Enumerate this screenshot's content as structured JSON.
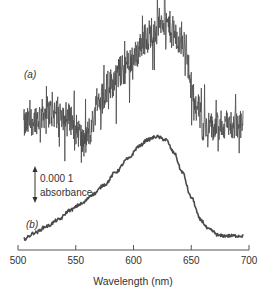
{
  "chart_data": {
    "type": "line",
    "title": "",
    "xlabel": "Wavelength (nm)",
    "ylabel": "",
    "xlim": [
      500,
      700
    ],
    "xticks": [
      500,
      550,
      600,
      650,
      700
    ],
    "grid": false,
    "legend": "none",
    "units_note": "y values are relative absorbance offsets (arbitrary baseline) in absorbance units; curves vertically offset for display",
    "scale_bar": {
      "value_line1": "0.000 1",
      "value_line2": "absorbance",
      "magnitude": 0.0001
    },
    "series": [
      {
        "name": "(a)",
        "label": "(a)",
        "style": "noisy",
        "color": "#4a4a4a",
        "x": [
          505,
          515,
          525,
          535,
          545,
          552,
          557,
          562,
          570,
          580,
          590,
          600,
          610,
          620,
          625,
          630,
          640,
          645,
          650,
          655,
          660,
          670,
          680,
          690,
          695
        ],
        "y": [
          0.0,
          2e-05,
          4e-05,
          4e-05,
          2e-05,
          -2e-05,
          -6e-05,
          -2e-05,
          8e-05,
          0.00013,
          0.00017,
          0.00021,
          0.00027,
          0.00031,
          0.00033,
          0.00031,
          0.00026,
          0.00025,
          0.00012,
          6e-05,
          0.0,
          -1e-05,
          0.0,
          0.0,
          0.0
        ],
        "noise_amplitude": 5e-05,
        "max_spike_x": 627
      },
      {
        "name": "(b)",
        "label": "(b)",
        "style": "smooth",
        "color": "#4a4a4a",
        "x": [
          505,
          515,
          525,
          535,
          545,
          555,
          565,
          575,
          585,
          595,
          605,
          612,
          620,
          628,
          635,
          642,
          650,
          658,
          665,
          675,
          685,
          695
        ],
        "y": [
          0.0,
          2e-05,
          4e-05,
          6e-05,
          9e-05,
          0.00011,
          0.00014,
          0.00017,
          0.00021,
          0.00025,
          0.00029,
          0.00031,
          0.00032,
          0.00031,
          0.00027,
          0.00021,
          0.00013,
          6e-05,
          3e-05,
          1e-05,
          1e-05,
          1e-05
        ],
        "noise_amplitude": 5e-06,
        "peak_x": 620
      }
    ]
  }
}
